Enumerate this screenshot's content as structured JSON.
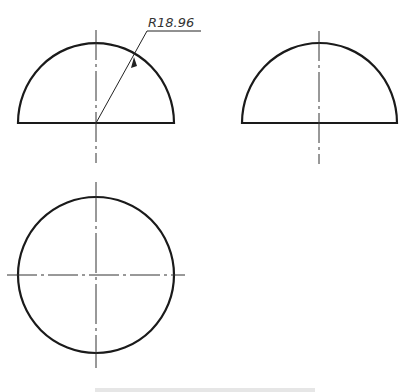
{
  "drawing": {
    "title": "Hemisphere orthographic views",
    "dimension": {
      "label": "R18.96",
      "type": "radius"
    },
    "views": [
      {
        "name": "front-view",
        "shape": "semicircle"
      },
      {
        "name": "side-view",
        "shape": "semicircle"
      },
      {
        "name": "top-view",
        "shape": "circle"
      }
    ],
    "colors": {
      "outline": "#1a1a1a",
      "centerline": "#333333",
      "background": "#ffffff"
    }
  }
}
